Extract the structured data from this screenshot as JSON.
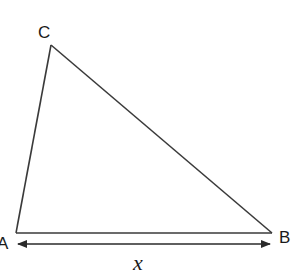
{
  "diagram": {
    "type": "triangle",
    "stroke_color": "#3a3a3a",
    "vertices": {
      "A": {
        "label": "A",
        "x": 16,
        "y": 233
      },
      "B": {
        "label": "B",
        "x": 272,
        "y": 233
      },
      "C": {
        "label": "C",
        "x": 51,
        "y": 45
      }
    },
    "labels": {
      "A": "A",
      "B": "B",
      "C": "C",
      "base_length": "x"
    },
    "dimension_arrow": {
      "from": "A",
      "to": "B",
      "label": "x",
      "double_headed": true
    }
  }
}
